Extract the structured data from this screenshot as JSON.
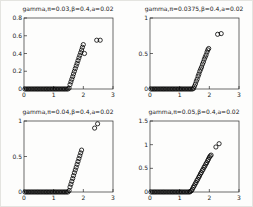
{
  "figure": {
    "background": "#fdfdfc",
    "axis_color": "#2b2b2b",
    "marker_color": "#000000",
    "marker": "open-circle",
    "grid": false,
    "legend": "none"
  },
  "chart_data": [
    {
      "type": "scatter",
      "title": "gamma,π=0.03,β=0.4,a=0.02",
      "xlabel": "",
      "ylabel": "",
      "xlim": [
        0,
        3
      ],
      "ylim": [
        0,
        0.8
      ],
      "xticks": [
        [
          0,
          "0"
        ],
        [
          1,
          "1"
        ],
        [
          2,
          "2"
        ],
        [
          3,
          "3"
        ]
      ],
      "yticks": [
        [
          0,
          "0"
        ],
        [
          0.2,
          "0.2"
        ],
        [
          0.4,
          "0.4"
        ],
        [
          0.6,
          "0.6"
        ],
        [
          0.8,
          "0.8"
        ]
      ],
      "series": [
        {
          "name": "gamma",
          "points": [
            [
              0.03,
              0
            ],
            [
              0.08,
              0
            ],
            [
              0.13,
              0
            ],
            [
              0.18,
              0
            ],
            [
              0.23,
              0
            ],
            [
              0.28,
              0
            ],
            [
              0.33,
              0
            ],
            [
              0.38,
              0
            ],
            [
              0.43,
              0
            ],
            [
              0.48,
              0
            ],
            [
              0.53,
              0
            ],
            [
              0.58,
              0
            ],
            [
              0.63,
              0
            ],
            [
              0.68,
              0
            ],
            [
              0.73,
              0
            ],
            [
              0.78,
              0
            ],
            [
              0.83,
              0
            ],
            [
              0.88,
              0
            ],
            [
              0.93,
              0
            ],
            [
              0.98,
              0
            ],
            [
              1.03,
              0
            ],
            [
              1.08,
              0
            ],
            [
              1.13,
              0
            ],
            [
              1.18,
              0
            ],
            [
              1.23,
              0
            ],
            [
              1.28,
              0
            ],
            [
              1.33,
              0
            ],
            [
              1.38,
              0
            ],
            [
              1.43,
              0
            ],
            [
              1.48,
              0
            ],
            [
              1.52,
              0.01
            ],
            [
              1.55,
              0.05
            ],
            [
              1.58,
              0.08
            ],
            [
              1.61,
              0.11
            ],
            [
              1.64,
              0.14
            ],
            [
              1.67,
              0.17
            ],
            [
              1.7,
              0.2
            ],
            [
              1.73,
              0.23
            ],
            [
              1.76,
              0.26
            ],
            [
              1.79,
              0.29
            ],
            [
              1.82,
              0.32
            ],
            [
              1.85,
              0.35
            ],
            [
              1.88,
              0.38
            ],
            [
              1.91,
              0.41
            ],
            [
              1.94,
              0.44
            ],
            [
              1.97,
              0.47
            ],
            [
              2.0,
              0.5
            ],
            [
              2.04,
              0.4
            ],
            [
              2.45,
              0.55
            ],
            [
              2.57,
              0.55
            ]
          ]
        }
      ]
    },
    {
      "type": "scatter",
      "title": "gamma,π=0.0375,β=0.4,a=0.02",
      "xlabel": "",
      "ylabel": "",
      "xlim": [
        0,
        3
      ],
      "ylim": [
        0,
        1
      ],
      "xticks": [
        [
          0,
          "0"
        ],
        [
          1,
          "1"
        ],
        [
          2,
          "2"
        ],
        [
          3,
          "3"
        ]
      ],
      "yticks": [
        [
          0,
          "0"
        ],
        [
          0.5,
          "0.5"
        ],
        [
          1,
          "1"
        ]
      ],
      "series": [
        {
          "name": "gamma",
          "points": [
            [
              0.03,
              0
            ],
            [
              0.08,
              0
            ],
            [
              0.13,
              0
            ],
            [
              0.18,
              0
            ],
            [
              0.23,
              0
            ],
            [
              0.28,
              0
            ],
            [
              0.33,
              0
            ],
            [
              0.38,
              0
            ],
            [
              0.43,
              0
            ],
            [
              0.48,
              0
            ],
            [
              0.53,
              0
            ],
            [
              0.58,
              0
            ],
            [
              0.63,
              0
            ],
            [
              0.68,
              0
            ],
            [
              0.73,
              0
            ],
            [
              0.78,
              0
            ],
            [
              0.83,
              0
            ],
            [
              0.88,
              0
            ],
            [
              0.93,
              0
            ],
            [
              0.98,
              0
            ],
            [
              1.03,
              0
            ],
            [
              1.08,
              0
            ],
            [
              1.13,
              0
            ],
            [
              1.18,
              0
            ],
            [
              1.23,
              0
            ],
            [
              1.28,
              0
            ],
            [
              1.33,
              0
            ],
            [
              1.38,
              0
            ],
            [
              1.43,
              0
            ],
            [
              1.47,
              0.01
            ],
            [
              1.5,
              0.04
            ],
            [
              1.53,
              0.07
            ],
            [
              1.56,
              0.11
            ],
            [
              1.59,
              0.14
            ],
            [
              1.62,
              0.18
            ],
            [
              1.65,
              0.21
            ],
            [
              1.68,
              0.25
            ],
            [
              1.71,
              0.28
            ],
            [
              1.74,
              0.31
            ],
            [
              1.77,
              0.35
            ],
            [
              1.8,
              0.38
            ],
            [
              1.83,
              0.42
            ],
            [
              1.86,
              0.45
            ],
            [
              1.89,
              0.48
            ],
            [
              1.92,
              0.52
            ],
            [
              1.95,
              0.55
            ],
            [
              1.98,
              0.57
            ],
            [
              2.28,
              0.77
            ],
            [
              2.4,
              0.78
            ]
          ]
        }
      ]
    },
    {
      "type": "scatter",
      "title": "gamma,π=0.04,β=0.4,a=0.02",
      "xlabel": "",
      "ylabel": "",
      "xlim": [
        0,
        3
      ],
      "ylim": [
        0,
        1
      ],
      "xticks": [
        [
          0,
          "0"
        ],
        [
          1,
          "1"
        ],
        [
          2,
          "2"
        ],
        [
          3,
          "3"
        ]
      ],
      "yticks": [
        [
          0,
          "0"
        ],
        [
          0.5,
          "0.5"
        ],
        [
          1,
          "1"
        ]
      ],
      "series": [
        {
          "name": "gamma",
          "points": [
            [
              0.03,
              0
            ],
            [
              0.08,
              0
            ],
            [
              0.13,
              0
            ],
            [
              0.18,
              0
            ],
            [
              0.23,
              0
            ],
            [
              0.28,
              0
            ],
            [
              0.33,
              0
            ],
            [
              0.38,
              0
            ],
            [
              0.43,
              0
            ],
            [
              0.48,
              0
            ],
            [
              0.53,
              0
            ],
            [
              0.58,
              0
            ],
            [
              0.63,
              0
            ],
            [
              0.68,
              0
            ],
            [
              0.73,
              0
            ],
            [
              0.78,
              0
            ],
            [
              0.83,
              0
            ],
            [
              0.88,
              0
            ],
            [
              0.93,
              0
            ],
            [
              0.98,
              0
            ],
            [
              1.03,
              0
            ],
            [
              1.08,
              0
            ],
            [
              1.13,
              0
            ],
            [
              1.18,
              0
            ],
            [
              1.23,
              0
            ],
            [
              1.28,
              0
            ],
            [
              1.33,
              0
            ],
            [
              1.38,
              0
            ],
            [
              1.43,
              0
            ],
            [
              1.48,
              0
            ],
            [
              1.52,
              0.02
            ],
            [
              1.55,
              0.07
            ],
            [
              1.58,
              0.11
            ],
            [
              1.61,
              0.15
            ],
            [
              1.64,
              0.19
            ],
            [
              1.67,
              0.23
            ],
            [
              1.7,
              0.27
            ],
            [
              1.73,
              0.31
            ],
            [
              1.76,
              0.35
            ],
            [
              1.79,
              0.39
            ],
            [
              1.82,
              0.43
            ],
            [
              1.85,
              0.47
            ],
            [
              1.88,
              0.51
            ],
            [
              1.91,
              0.55
            ],
            [
              1.94,
              0.59
            ],
            [
              2.38,
              0.9
            ],
            [
              2.48,
              0.96
            ]
          ]
        }
      ]
    },
    {
      "type": "scatter",
      "title": "gamma,π=0.05,β=0.4,a=0.02",
      "xlabel": "",
      "ylabel": "",
      "xlim": [
        0,
        3
      ],
      "ylim": [
        0,
        1.5
      ],
      "xticks": [
        [
          0,
          "0"
        ],
        [
          1,
          "1"
        ],
        [
          2,
          "2"
        ],
        [
          3,
          "3"
        ]
      ],
      "yticks": [
        [
          0,
          "0"
        ],
        [
          0.5,
          "0.5"
        ],
        [
          1,
          "1"
        ],
        [
          1.5,
          "1.5"
        ]
      ],
      "series": [
        {
          "name": "gamma",
          "points": [
            [
              0.03,
              0
            ],
            [
              0.08,
              0
            ],
            [
              0.13,
              0
            ],
            [
              0.18,
              0
            ],
            [
              0.23,
              0
            ],
            [
              0.28,
              0
            ],
            [
              0.33,
              0
            ],
            [
              0.38,
              0
            ],
            [
              0.43,
              0
            ],
            [
              0.48,
              0
            ],
            [
              0.53,
              0
            ],
            [
              0.58,
              0
            ],
            [
              0.63,
              0
            ],
            [
              0.68,
              0
            ],
            [
              0.73,
              0
            ],
            [
              0.78,
              0
            ],
            [
              0.83,
              0
            ],
            [
              0.88,
              0
            ],
            [
              0.93,
              0
            ],
            [
              0.98,
              0
            ],
            [
              1.03,
              0
            ],
            [
              1.08,
              0
            ],
            [
              1.13,
              0
            ],
            [
              1.18,
              0
            ],
            [
              1.23,
              0
            ],
            [
              1.28,
              0
            ],
            [
              1.33,
              0
            ],
            [
              1.36,
              0.01
            ],
            [
              1.4,
              0.03
            ],
            [
              1.43,
              0.06
            ],
            [
              1.46,
              0.1
            ],
            [
              1.49,
              0.13
            ],
            [
              1.52,
              0.17
            ],
            [
              1.55,
              0.2
            ],
            [
              1.58,
              0.24
            ],
            [
              1.61,
              0.27
            ],
            [
              1.64,
              0.31
            ],
            [
              1.67,
              0.34
            ],
            [
              1.7,
              0.38
            ],
            [
              1.73,
              0.41
            ],
            [
              1.76,
              0.45
            ],
            [
              1.79,
              0.48
            ],
            [
              1.82,
              0.52
            ],
            [
              1.85,
              0.55
            ],
            [
              1.88,
              0.59
            ],
            [
              1.91,
              0.62
            ],
            [
              1.94,
              0.66
            ],
            [
              1.97,
              0.69
            ],
            [
              2.0,
              0.73
            ],
            [
              2.03,
              0.76
            ],
            [
              2.06,
              0.78
            ],
            [
              2.22,
              0.95
            ],
            [
              2.33,
              1.02
            ]
          ]
        }
      ]
    }
  ]
}
